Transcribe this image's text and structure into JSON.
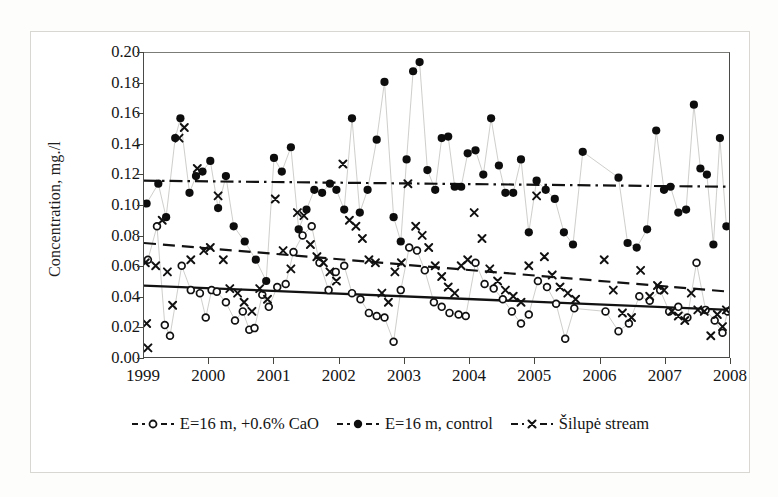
{
  "figure": {
    "kind": "scientific-scatter-figure"
  },
  "chart_data": {
    "type": "scatter",
    "title": "",
    "xlabel": "",
    "ylabel": "Concentration, mg./l",
    "xlim": [
      1999,
      2008
    ],
    "ylim": [
      0.0,
      0.2
    ],
    "grid": false,
    "legend_position": "bottom",
    "yticks": [
      "0.20",
      "0.18",
      "0.16",
      "0.14",
      "0.12",
      "0.10",
      "0.08",
      "0.06",
      "0.04",
      "0.02",
      "0.00"
    ],
    "ytick_values": [
      0.2,
      0.18,
      0.16,
      0.14,
      0.12,
      0.1,
      0.08,
      0.06,
      0.04,
      0.02,
      0.0
    ],
    "xticks": [
      "1999",
      "2000",
      "2001",
      "2002",
      "2003",
      "2004",
      "2005",
      "2006",
      "2007",
      "2008"
    ],
    "xtick_values": [
      1999,
      2000,
      2001,
      2002,
      2003,
      2004,
      2005,
      2006,
      2007,
      2008
    ],
    "series": [
      {
        "name": "E=16 m, +0.6% CaO",
        "marker": "open-circle",
        "connector": "thin-line",
        "color": "#111111",
        "points": [
          [
            1999.06,
            0.064
          ],
          [
            1999.2,
            0.086
          ],
          [
            1999.32,
            0.021
          ],
          [
            1999.4,
            0.014
          ],
          [
            1999.58,
            0.06
          ],
          [
            1999.72,
            0.044
          ],
          [
            1999.86,
            0.042
          ],
          [
            1999.95,
            0.026
          ],
          [
            2000.04,
            0.044
          ],
          [
            2000.12,
            0.043
          ],
          [
            2000.26,
            0.036
          ],
          [
            2000.4,
            0.024
          ],
          [
            2000.52,
            0.03
          ],
          [
            2000.62,
            0.018
          ],
          [
            2000.7,
            0.019
          ],
          [
            2000.82,
            0.041
          ],
          [
            2000.92,
            0.033
          ],
          [
            2001.05,
            0.046
          ],
          [
            2001.18,
            0.048
          ],
          [
            2001.3,
            0.069
          ],
          [
            2001.44,
            0.08
          ],
          [
            2001.58,
            0.086
          ],
          [
            2001.7,
            0.062
          ],
          [
            2001.84,
            0.044
          ],
          [
            2001.95,
            0.056
          ],
          [
            2002.08,
            0.06
          ],
          [
            2002.2,
            0.042
          ],
          [
            2002.33,
            0.038
          ],
          [
            2002.46,
            0.029
          ],
          [
            2002.58,
            0.027
          ],
          [
            2002.7,
            0.026
          ],
          [
            2002.84,
            0.01
          ],
          [
            2002.95,
            0.044
          ],
          [
            2003.08,
            0.072
          ],
          [
            2003.2,
            0.07
          ],
          [
            2003.32,
            0.057
          ],
          [
            2003.46,
            0.036
          ],
          [
            2003.58,
            0.033
          ],
          [
            2003.7,
            0.029
          ],
          [
            2003.84,
            0.028
          ],
          [
            2003.95,
            0.027
          ],
          [
            2004.1,
            0.062
          ],
          [
            2004.24,
            0.048
          ],
          [
            2004.38,
            0.045
          ],
          [
            2004.52,
            0.038
          ],
          [
            2004.66,
            0.03
          ],
          [
            2004.8,
            0.022
          ],
          [
            2004.92,
            0.028
          ],
          [
            2005.06,
            0.05
          ],
          [
            2005.2,
            0.046
          ],
          [
            2005.34,
            0.035
          ],
          [
            2005.48,
            0.012
          ],
          [
            2005.62,
            0.032
          ],
          [
            2006.1,
            0.03
          ],
          [
            2006.3,
            0.017
          ],
          [
            2006.46,
            0.022
          ],
          [
            2006.62,
            0.04
          ],
          [
            2006.78,
            0.037
          ],
          [
            2006.94,
            0.044
          ],
          [
            2007.08,
            0.03
          ],
          [
            2007.22,
            0.033
          ],
          [
            2007.36,
            0.026
          ],
          [
            2007.5,
            0.062
          ],
          [
            2007.64,
            0.031
          ],
          [
            2007.78,
            0.024
          ],
          [
            2007.9,
            0.016
          ],
          [
            2007.98,
            0.03
          ]
        ]
      },
      {
        "name": "E=16 m, control",
        "marker": "filled-circle",
        "connector": "thin-line",
        "color": "#0d0d0d",
        "points": [
          [
            1999.04,
            0.101
          ],
          [
            1999.22,
            0.114
          ],
          [
            1999.34,
            0.092
          ],
          [
            1999.48,
            0.144
          ],
          [
            1999.56,
            0.157
          ],
          [
            1999.7,
            0.108
          ],
          [
            1999.8,
            0.119
          ],
          [
            1999.9,
            0.122
          ],
          [
            2000.02,
            0.129
          ],
          [
            2000.14,
            0.098
          ],
          [
            2000.26,
            0.119
          ],
          [
            2000.38,
            0.086
          ],
          [
            2000.55,
            0.076
          ],
          [
            2000.72,
            0.064
          ],
          [
            2000.88,
            0.05
          ],
          [
            2001.0,
            0.131
          ],
          [
            2001.12,
            0.122
          ],
          [
            2001.26,
            0.138
          ],
          [
            2001.38,
            0.084
          ],
          [
            2001.5,
            0.097
          ],
          [
            2001.62,
            0.11
          ],
          [
            2001.74,
            0.108
          ],
          [
            2001.86,
            0.114
          ],
          [
            2001.96,
            0.11
          ],
          [
            2002.08,
            0.097
          ],
          [
            2002.2,
            0.157
          ],
          [
            2002.32,
            0.095
          ],
          [
            2002.44,
            0.11
          ],
          [
            2002.58,
            0.143
          ],
          [
            2002.7,
            0.181
          ],
          [
            2002.84,
            0.092
          ],
          [
            2002.95,
            0.076
          ],
          [
            2003.04,
            0.13
          ],
          [
            2003.14,
            0.188
          ],
          [
            2003.24,
            0.194
          ],
          [
            2003.36,
            0.123
          ],
          [
            2003.48,
            0.11
          ],
          [
            2003.58,
            0.144
          ],
          [
            2003.68,
            0.145
          ],
          [
            2003.78,
            0.112
          ],
          [
            2003.88,
            0.112
          ],
          [
            2003.98,
            0.134
          ],
          [
            2004.1,
            0.136
          ],
          [
            2004.22,
            0.12
          ],
          [
            2004.34,
            0.157
          ],
          [
            2004.46,
            0.126
          ],
          [
            2004.56,
            0.108
          ],
          [
            2004.68,
            0.108
          ],
          [
            2004.8,
            0.13
          ],
          [
            2004.92,
            0.082
          ],
          [
            2005.04,
            0.116
          ],
          [
            2005.18,
            0.11
          ],
          [
            2005.32,
            0.104
          ],
          [
            2005.46,
            0.082
          ],
          [
            2005.6,
            0.074
          ],
          [
            2005.75,
            0.135
          ],
          [
            2006.3,
            0.118
          ],
          [
            2006.44,
            0.075
          ],
          [
            2006.58,
            0.072
          ],
          [
            2006.74,
            0.084
          ],
          [
            2006.88,
            0.149
          ],
          [
            2007.0,
            0.11
          ],
          [
            2007.1,
            0.112
          ],
          [
            2007.22,
            0.095
          ],
          [
            2007.34,
            0.097
          ],
          [
            2007.46,
            0.166
          ],
          [
            2007.56,
            0.124
          ],
          [
            2007.66,
            0.12
          ],
          [
            2007.76,
            0.074
          ],
          [
            2007.86,
            0.144
          ],
          [
            2007.96,
            0.086
          ]
        ]
      },
      {
        "name": "Šilupė stream",
        "marker": "x-cross",
        "connector": "none",
        "color": "#111111",
        "points": [
          [
            1999.02,
            0.062
          ],
          [
            1999.04,
            0.022
          ],
          [
            1999.06,
            0.006
          ],
          [
            1999.18,
            0.06
          ],
          [
            1999.28,
            0.09
          ],
          [
            1999.36,
            0.056
          ],
          [
            1999.44,
            0.034
          ],
          [
            1999.54,
            0.144
          ],
          [
            1999.62,
            0.151
          ],
          [
            1999.72,
            0.064
          ],
          [
            1999.82,
            0.124
          ],
          [
            1999.92,
            0.07
          ],
          [
            2000.02,
            0.072
          ],
          [
            2000.14,
            0.106
          ],
          [
            2000.22,
            0.064
          ],
          [
            2000.32,
            0.045
          ],
          [
            2000.44,
            0.042
          ],
          [
            2000.54,
            0.036
          ],
          [
            2000.66,
            0.03
          ],
          [
            2000.78,
            0.045
          ],
          [
            2000.9,
            0.038
          ],
          [
            2001.02,
            0.104
          ],
          [
            2001.14,
            0.07
          ],
          [
            2001.26,
            0.058
          ],
          [
            2001.36,
            0.095
          ],
          [
            2001.46,
            0.093
          ],
          [
            2001.56,
            0.074
          ],
          [
            2001.66,
            0.066
          ],
          [
            2001.76,
            0.062
          ],
          [
            2001.86,
            0.056
          ],
          [
            2001.96,
            0.05
          ],
          [
            2002.06,
            0.127
          ],
          [
            2002.16,
            0.09
          ],
          [
            2002.26,
            0.086
          ],
          [
            2002.36,
            0.078
          ],
          [
            2002.46,
            0.064
          ],
          [
            2002.56,
            0.062
          ],
          [
            2002.66,
            0.042
          ],
          [
            2002.76,
            0.036
          ],
          [
            2002.86,
            0.056
          ],
          [
            2002.96,
            0.062
          ],
          [
            2003.06,
            0.114
          ],
          [
            2003.18,
            0.086
          ],
          [
            2003.28,
            0.08
          ],
          [
            2003.38,
            0.072
          ],
          [
            2003.48,
            0.06
          ],
          [
            2003.58,
            0.053
          ],
          [
            2003.68,
            0.046
          ],
          [
            2003.78,
            0.042
          ],
          [
            2003.88,
            0.06
          ],
          [
            2003.98,
            0.064
          ],
          [
            2004.08,
            0.095
          ],
          [
            2004.2,
            0.078
          ],
          [
            2004.32,
            0.058
          ],
          [
            2004.44,
            0.05
          ],
          [
            2004.56,
            0.044
          ],
          [
            2004.68,
            0.04
          ],
          [
            2004.8,
            0.036
          ],
          [
            2004.92,
            0.06
          ],
          [
            2005.04,
            0.106
          ],
          [
            2005.16,
            0.066
          ],
          [
            2005.28,
            0.054
          ],
          [
            2005.4,
            0.046
          ],
          [
            2005.52,
            0.042
          ],
          [
            2005.64,
            0.038
          ],
          [
            2006.08,
            0.064
          ],
          [
            2006.22,
            0.044
          ],
          [
            2006.36,
            0.029
          ],
          [
            2006.5,
            0.026
          ],
          [
            2006.64,
            0.057
          ],
          [
            2006.78,
            0.04
          ],
          [
            2006.9,
            0.047
          ],
          [
            2007.0,
            0.044
          ],
          [
            2007.12,
            0.03
          ],
          [
            2007.22,
            0.027
          ],
          [
            2007.32,
            0.024
          ],
          [
            2007.42,
            0.042
          ],
          [
            2007.52,
            0.031
          ],
          [
            2007.62,
            0.03
          ],
          [
            2007.72,
            0.014
          ],
          [
            2007.82,
            0.028
          ],
          [
            2007.9,
            0.02
          ],
          [
            2007.96,
            0.031
          ]
        ]
      }
    ],
    "trendlines": [
      {
        "name": "trend-silupe-stream",
        "style": "solid",
        "x0": 1999.0,
        "y0": 0.047,
        "x1": 2008.0,
        "y1": 0.031
      },
      {
        "name": "trend-cao",
        "style": "dashed",
        "x0": 1999.0,
        "y0": 0.075,
        "x1": 2008.0,
        "y1": 0.043
      },
      {
        "name": "trend-control",
        "style": "dash-dot",
        "x0": 1999.0,
        "y0": 0.116,
        "x1": 2008.0,
        "y1": 0.112
      }
    ]
  },
  "legend": {
    "items": [
      {
        "label": "E=16 m, +0.6% CaO",
        "marker": "open-circle"
      },
      {
        "label": "E=16 m, control",
        "marker": "filled-circle"
      },
      {
        "label": "Šilupė stream",
        "marker": "x-cross"
      }
    ]
  }
}
